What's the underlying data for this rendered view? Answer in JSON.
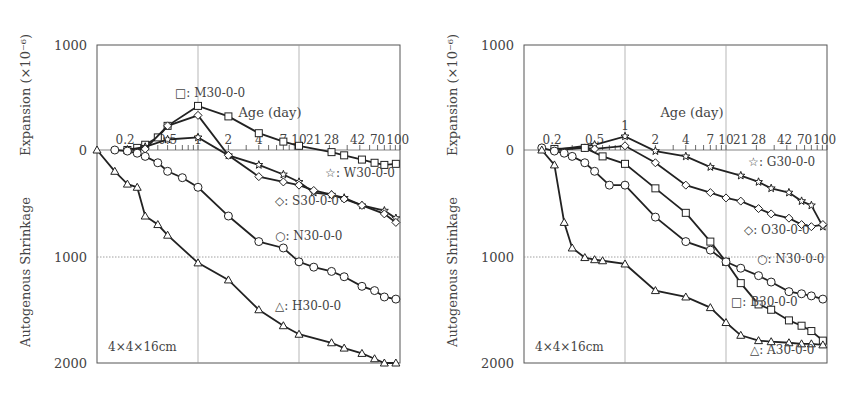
{
  "chart_data": [
    {
      "type": "line",
      "title": "",
      "xlabel": "Age (day)",
      "ylabel_top": "Expansion (×10⁻⁶)",
      "ylabel_bottom": "Autogenous Shrinkage",
      "specimen": "4×4×16cm",
      "x_scale": "log",
      "x_ticks": [
        "0.2",
        "0.5",
        "1",
        "2",
        "4",
        "7",
        "10",
        "21",
        "28",
        "42",
        "70",
        "100"
      ],
      "y_ticks": [
        "1000",
        "0",
        "1000",
        "2000"
      ],
      "ylim": [
        -2000,
        1000
      ],
      "grid": true,
      "series": [
        {
          "name": "M30-0-0",
          "marker": "square",
          "x": [
            0.2,
            0.25,
            0.3,
            0.4,
            0.5,
            1,
            2,
            4,
            7,
            10,
            21,
            28,
            42,
            56,
            70,
            91
          ],
          "y": [
            0,
            20,
            50,
            120,
            230,
            420,
            320,
            160,
            80,
            40,
            -20,
            -50,
            -90,
            -120,
            -140,
            -130
          ]
        },
        {
          "name": "W30-0-0",
          "marker": "star",
          "x": [
            0.2,
            0.3,
            0.5,
            1,
            2,
            4,
            7,
            10,
            14,
            21,
            28,
            42,
            70,
            91
          ],
          "y": [
            0,
            30,
            100,
            120,
            -50,
            -140,
            -230,
            -300,
            -400,
            -420,
            -450,
            -520,
            -570,
            -640
          ]
        },
        {
          "name": "S30-0-0",
          "marker": "diamond",
          "x": [
            0.2,
            0.3,
            0.5,
            1,
            2,
            4,
            7,
            10,
            14,
            21,
            28,
            42,
            70,
            91
          ],
          "y": [
            0,
            10,
            230,
            330,
            -50,
            -250,
            -300,
            -330,
            -380,
            -420,
            -460,
            -520,
            -600,
            -680
          ]
        },
        {
          "name": "N30-0-0",
          "marker": "circle",
          "x": [
            0.15,
            0.2,
            0.25,
            0.3,
            0.4,
            0.5,
            0.7,
            1,
            2,
            4,
            7,
            10,
            14,
            21,
            28,
            42,
            56,
            70,
            91
          ],
          "y": [
            0,
            -10,
            -30,
            -60,
            -120,
            -200,
            -260,
            -350,
            -620,
            -860,
            -920,
            -1050,
            -1100,
            -1140,
            -1190,
            -1280,
            -1320,
            -1380,
            -1400
          ]
        },
        {
          "name": "H30-0-0",
          "marker": "triangle",
          "x": [
            0.1,
            0.15,
            0.2,
            0.25,
            0.3,
            0.4,
            0.5,
            1,
            2,
            4,
            7,
            10,
            21,
            28,
            42,
            56,
            70,
            91
          ],
          "y": [
            0,
            -200,
            -320,
            -350,
            -620,
            -700,
            -800,
            -1060,
            -1220,
            -1500,
            -1650,
            -1730,
            -1810,
            -1860,
            -1910,
            -1960,
            -2000,
            -2000
          ]
        }
      ]
    },
    {
      "type": "line",
      "title": "",
      "xlabel": "Age (day)",
      "ylabel_top": "Expansion (×10⁻⁶)",
      "ylabel_bottom": "Autogenous Shrinkage",
      "specimen": "4×4×16cm",
      "x_scale": "log",
      "x_ticks": [
        "0.2",
        "0.5",
        "1",
        "2",
        "4",
        "7",
        "10",
        "21",
        "28",
        "42",
        "70",
        "100"
      ],
      "y_ticks": [
        "1000",
        "0",
        "1000",
        "2000"
      ],
      "ylim": [
        -2000,
        1000
      ],
      "grid": true,
      "series": [
        {
          "name": "G30-0-0",
          "marker": "star",
          "x": [
            0.2,
            0.5,
            1,
            2,
            4,
            7,
            14,
            21,
            28,
            42,
            56,
            70,
            91
          ],
          "y": [
            0,
            50,
            130,
            -10,
            -60,
            -160,
            -240,
            -300,
            -360,
            -400,
            -480,
            -520,
            -720
          ]
        },
        {
          "name": "O30-0-0",
          "marker": "diamond",
          "x": [
            0.2,
            0.4,
            0.5,
            1,
            2,
            4,
            7,
            10,
            14,
            21,
            28,
            42,
            56,
            70,
            91
          ],
          "y": [
            0,
            20,
            10,
            40,
            -120,
            -330,
            -400,
            -450,
            -480,
            -550,
            -600,
            -640,
            -700,
            -720,
            -700
          ]
        },
        {
          "name": "B30-0-0",
          "marker": "square",
          "x": [
            0.2,
            0.4,
            0.6,
            1,
            2,
            4,
            7,
            10,
            14,
            21,
            28,
            42,
            56,
            70,
            91
          ],
          "y": [
            10,
            20,
            -60,
            -130,
            -360,
            -590,
            -860,
            -1050,
            -1250,
            -1450,
            -1500,
            -1600,
            -1650,
            -1700,
            -1790
          ]
        },
        {
          "name": "N30-0-0",
          "marker": "circle",
          "x": [
            0.15,
            0.2,
            0.25,
            0.3,
            0.4,
            0.5,
            0.7,
            1,
            2,
            4,
            7,
            10,
            14,
            21,
            28,
            42,
            56,
            70,
            91
          ],
          "y": [
            20,
            -10,
            -30,
            -60,
            -120,
            -200,
            -330,
            -330,
            -630,
            -860,
            -940,
            -1050,
            -1110,
            -1180,
            -1240,
            -1330,
            -1350,
            -1370,
            -1400
          ]
        },
        {
          "name": "A30-0-0",
          "marker": "triangle",
          "x": [
            0.15,
            0.2,
            0.25,
            0.3,
            0.4,
            0.5,
            0.6,
            1,
            2,
            4,
            7,
            10,
            14,
            21,
            28,
            42,
            56,
            70,
            91
          ],
          "y": [
            0,
            -140,
            -680,
            -920,
            -1010,
            -1030,
            -1040,
            -1070,
            -1320,
            -1380,
            -1480,
            -1620,
            -1740,
            -1790,
            -1800,
            -1810,
            -1820,
            -1820,
            -1830
          ]
        }
      ]
    }
  ]
}
